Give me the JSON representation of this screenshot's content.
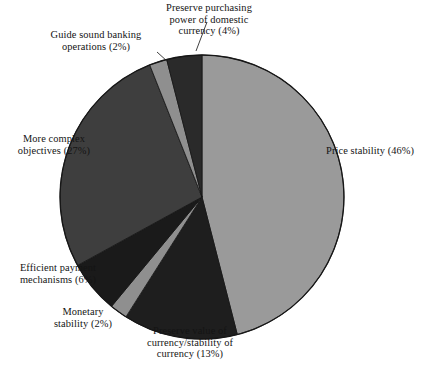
{
  "chart_data": {
    "type": "pie",
    "title": "",
    "subtitle": "",
    "xlabel": "",
    "ylabel": "",
    "legend_position": "none",
    "grid": false,
    "labels_outside": true,
    "units": "percent",
    "categories": [
      "Price stability",
      "Preserve value of currency/stability of currency",
      "Monetary stability",
      "Efficient payment mechanisms",
      "More complex objectives",
      "Guide sound banking operations",
      "Preserve purchasing power of domestic currency"
    ],
    "values": [
      46,
      13,
      2,
      6,
      27,
      2,
      4
    ],
    "slices": [
      {
        "id": "price-stability",
        "label": "Price stability (46%)",
        "name": "Price stability",
        "value": 46,
        "color": "#9a9a9a",
        "start_angle": 0,
        "end_angle": 165.6
      },
      {
        "id": "preserve-value-of-currency",
        "label": "Preserve value of\ncurrency/stability of\ncurrency (13%)",
        "name": "Preserve value of currency/stability of currency",
        "value": 13,
        "color": "#1e1e1e",
        "start_angle": 165.6,
        "end_angle": 212.4
      },
      {
        "id": "monetary-stability",
        "label": "Monetary\nstability (2%)",
        "name": "Monetary stability",
        "value": 2,
        "color": "#8f8f8f",
        "start_angle": 212.4,
        "end_angle": 219.6
      },
      {
        "id": "efficient-payment-mechanisms",
        "label": "Efficient payment\nmechanisms (6%)",
        "name": "Efficient payment mechanisms",
        "value": 6,
        "color": "#1a1a1a",
        "start_angle": 219.6,
        "end_angle": 241.2
      },
      {
        "id": "more-complex-objectives",
        "label": "More complex\nobjectives (27%)",
        "name": "More complex objectives",
        "value": 27,
        "color": "#3e3e3e",
        "start_angle": 241.2,
        "end_angle": 338.4
      },
      {
        "id": "guide-sound-banking-operations",
        "label": "Guide sound banking\noperations (2%)",
        "name": "Guide sound banking operations",
        "value": 2,
        "color": "#8f8f8f",
        "start_angle": 338.4,
        "end_angle": 345.6
      },
      {
        "id": "preserve-purchasing-power",
        "label": "Preserve purchasing\npower of domestic\ncurrency (4%)",
        "name": "Preserve purchasing power of domestic currency",
        "value": 4,
        "color": "#2a2a2a",
        "start_angle": 345.6,
        "end_angle": 360
      }
    ]
  },
  "figure": {
    "caption": "",
    "outline_color": "#1a1a1a"
  }
}
